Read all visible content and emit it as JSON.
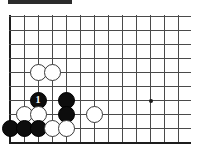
{
  "figure": {
    "kind": "go-board-diagram",
    "caption_bar": {
      "visible": true,
      "color": "#2b2b2b",
      "text": ""
    }
  },
  "board": {
    "columns": 13,
    "rows": 10,
    "cell_size": 14,
    "origin_x": 10,
    "origin_y": 16,
    "line_color": "#4a4a4a",
    "edge_color": "#1c1c1c",
    "background_color": "#ffffff",
    "left_edge_is_board_border": true,
    "bottom_edge_is_board_border": true,
    "top_edge_is_board_border": false,
    "right_edge_is_board_border": false,
    "star_points": [
      {
        "col": 10,
        "row": 6
      }
    ]
  },
  "stones": [
    {
      "color": "white",
      "col": 2,
      "row": 4,
      "label": ""
    },
    {
      "color": "white",
      "col": 3,
      "row": 4,
      "label": ""
    },
    {
      "color": "black",
      "col": 2,
      "row": 6,
      "label": "1"
    },
    {
      "color": "black",
      "col": 4,
      "row": 6,
      "label": ""
    },
    {
      "color": "white",
      "col": 1,
      "row": 7,
      "label": ""
    },
    {
      "color": "white",
      "col": 2,
      "row": 7,
      "label": ""
    },
    {
      "color": "black",
      "col": 4,
      "row": 7,
      "label": ""
    },
    {
      "color": "white",
      "col": 6,
      "row": 7,
      "label": ""
    },
    {
      "color": "black",
      "col": 0,
      "row": 8,
      "label": ""
    },
    {
      "color": "black",
      "col": 1,
      "row": 8,
      "label": ""
    },
    {
      "color": "black",
      "col": 2,
      "row": 8,
      "label": ""
    },
    {
      "color": "white",
      "col": 3,
      "row": 8,
      "label": ""
    },
    {
      "color": "white",
      "col": 4,
      "row": 8,
      "label": ""
    }
  ],
  "colors": {
    "black_stone": "#0d0d0d",
    "white_stone": "#ffffff",
    "white_stone_outline": "#3a3a3a",
    "grid": "#4a4a4a",
    "board_edge": "#1c1c1c",
    "header_bar": "#2b2b2b"
  },
  "header_bar_geometry": {
    "x": 8,
    "y": 0,
    "width": 64,
    "height": 4
  }
}
